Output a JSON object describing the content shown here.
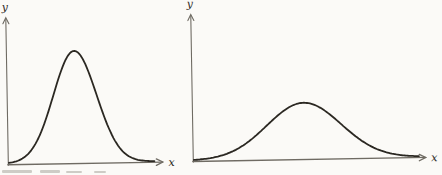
{
  "figure": {
    "background": "#fbfaf7",
    "curve_color": "#2b2822",
    "axis_color": "#6f6b63",
    "panels": [
      {
        "id": "left",
        "ylabel": "y",
        "xlabel": "x"
      },
      {
        "id": "right",
        "ylabel": "y",
        "xlabel": "x"
      }
    ]
  },
  "chart_data": [
    {
      "type": "line",
      "title": "",
      "xlabel": "x",
      "ylabel": "y",
      "grid": false,
      "legend": null,
      "axis_ticks": "none",
      "description": "Tall narrow bell-shaped (normal) frequency curve rising from the origin, peaking left of axis center, returning to the baseline",
      "curve": {
        "shape": "gaussian",
        "peak_x_frac": 0.44,
        "sigma_frac": 0.14,
        "height_frac": 0.76
      }
    },
    {
      "type": "line",
      "title": "",
      "xlabel": "x",
      "ylabel": "y",
      "grid": false,
      "legend": null,
      "axis_ticks": "none",
      "description": "Low wide bell-shaped (normal) frequency curve spread across most of the axis, about half the height of the left curve",
      "curve": {
        "shape": "gaussian",
        "peak_x_frac": 0.48,
        "sigma_frac": 0.16,
        "height_frac": 0.38
      }
    }
  ]
}
